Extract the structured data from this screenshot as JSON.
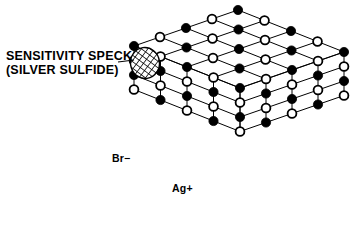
{
  "figure": {
    "background_color": "#ffffff",
    "ink_color": "#000000"
  },
  "labels": {
    "speck_line1": "SENSITIVITY SPECK",
    "speck_line2": "(SILVER SULFIDE)",
    "bromide": "Br−",
    "silver": "Ag+"
  },
  "legend_markers": {
    "bromide_marker": "open-circle",
    "silver_marker": "filled-circle",
    "speck_marker": "cross-hatched-oval"
  },
  "chart_data": {
    "type": "diagram",
    "projection": {
      "origin_front_top": [
        240,
        88
      ],
      "u_right": [
        26.0,
        -9.0
      ],
      "v_left": [
        -26.5,
        -10.5
      ],
      "w_down": [
        0,
        43.5
      ],
      "grid_n": 4,
      "depth_levels": 3
    },
    "colors": {
      "line": "#000000",
      "filled_ion": "#000000",
      "open_ion": "#ffffff"
    },
    "ion_sizes": {
      "filled_radius": 4.6,
      "open_radius": 4.4,
      "open_stroke": 1.8
    },
    "speck": {
      "center": [
        145,
        63
      ],
      "rx": 14.5,
      "ry": 15.5,
      "rotation_deg": -8,
      "hatch_spacing": 2.6,
      "hatch_width": 1.0
    },
    "leader_line": {
      "from": [
        118,
        62
      ],
      "to": [
        134,
        60
      ]
    },
    "parity_rule": "ion filled when (i + j + k) is even"
  }
}
